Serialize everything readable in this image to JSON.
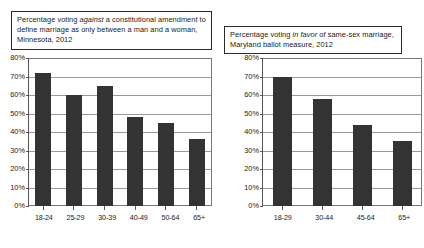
{
  "panels": [
    {
      "id": "minnesota",
      "title_parts": {
        "before": "Percentage voting ",
        "emphasis": "against",
        "after": " a constitutional amendment to define marriage as only between a man and a woman, Minnesota, 2012"
      },
      "chart_data": {
        "type": "bar",
        "title": "Percentage voting against a constitutional amendment to define marriage as only between a man and a woman, Minnesota, 2012",
        "xlabel": "",
        "ylabel": "",
        "categories": [
          "18-24",
          "25-29",
          "30-39",
          "40-49",
          "50-64",
          "65+"
        ],
        "values": [
          72,
          60,
          65,
          48,
          45,
          36
        ],
        "ylim": [
          0,
          80
        ],
        "yticks": [
          0,
          10,
          20,
          30,
          40,
          50,
          60,
          70,
          80
        ],
        "ytick_labels": [
          "0%",
          "10%",
          "20%",
          "30%",
          "40%",
          "50%",
          "60%",
          "70%",
          "80%"
        ],
        "grid": true,
        "legend": "none",
        "bar_color": "#333333"
      }
    },
    {
      "id": "maryland",
      "title_parts": {
        "before": "Percentage voting ",
        "emphasis": "in favor",
        "after": " of same-sex marriage, Maryland ballot measure, 2012"
      },
      "chart_data": {
        "type": "bar",
        "title": "Percentage voting in favor of same-sex marriage, Maryland ballot measure, 2012",
        "xlabel": "",
        "ylabel": "",
        "categories": [
          "18-29",
          "30-44",
          "45-64",
          "65+"
        ],
        "values": [
          70,
          58,
          44,
          35
        ],
        "ylim": [
          0,
          80
        ],
        "yticks": [
          0,
          10,
          20,
          30,
          40,
          50,
          60,
          70,
          80
        ],
        "ytick_labels": [
          "0%",
          "10%",
          "20%",
          "30%",
          "40%",
          "50%",
          "60%",
          "70%",
          "80%"
        ],
        "grid": true,
        "legend": "none",
        "bar_color": "#333333"
      }
    }
  ]
}
